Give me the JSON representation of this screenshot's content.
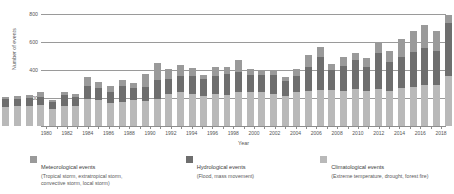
{
  "chart_data": {
    "type": "bar",
    "subtype": "stacked-bar",
    "title": "",
    "xlabel": "Year",
    "ylabel": "Number of events",
    "ylim": [
      0,
      800
    ],
    "y_ticks": [
      200,
      400,
      600,
      800
    ],
    "grid": true,
    "legend_position": "bottom",
    "categories": [
      "1980",
      "1981",
      "1982",
      "1983",
      "1984",
      "1985",
      "1986",
      "1987",
      "1988",
      "1989",
      "1990",
      "1991",
      "1992",
      "1993",
      "1994",
      "1995",
      "1996",
      "1997",
      "1998",
      "1999",
      "2000",
      "2001",
      "2002",
      "2003",
      "2004",
      "2005",
      "2006",
      "2007",
      "2008",
      "2009",
      "2010",
      "2011",
      "2012",
      "2013",
      "2014",
      "2015",
      "2016",
      "2017",
      "2018"
    ],
    "x_tick_labels": [
      "1980",
      "",
      "1982",
      "",
      "1984",
      "",
      "1986",
      "",
      "1988",
      "",
      "1990",
      "",
      "1992",
      "",
      "1994",
      "",
      "1996",
      "",
      "1998",
      "",
      "2000",
      "",
      "2002",
      "",
      "2004",
      "",
      "2006",
      "",
      "2008",
      "",
      "2010",
      "",
      "2012",
      "",
      "2014",
      "",
      "2016",
      "",
      "2018"
    ],
    "series": [
      {
        "name": "Climatological events",
        "color": "#b9b9b9",
        "values": [
          135,
          140,
          140,
          150,
          120,
          145,
          140,
          195,
          185,
          165,
          175,
          185,
          180,
          195,
          230,
          240,
          230,
          215,
          230,
          225,
          240,
          240,
          240,
          230,
          215,
          240,
          250,
          260,
          260,
          250,
          265,
          250,
          265,
          250,
          270,
          280,
          295,
          290,
          355
        ]
      },
      {
        "name": "Hydrological events",
        "color": "#6e6e6e",
        "values": [
          55,
          55,
          60,
          60,
          50,
          75,
          65,
          90,
          90,
          80,
          110,
          90,
          100,
          135,
          105,
          115,
          130,
          120,
          130,
          145,
          145,
          125,
          125,
          135,
          105,
          120,
          175,
          235,
          140,
          180,
          205,
          175,
          255,
          210,
          225,
          250,
          265,
          245,
          380
        ]
      },
      {
        "name": "Meteorological events",
        "color": "#9a9a9a",
        "values": [
          20,
          20,
          20,
          30,
          15,
          25,
          25,
          65,
          40,
          40,
          45,
          30,
          90,
          120,
          75,
          80,
          55,
          30,
          60,
          50,
          85,
          45,
          30,
          25,
          30,
          50,
          85,
          70,
          45,
          60,
          50,
          60,
          80,
          75,
          125,
          150,
          160,
          145,
          55
        ]
      }
    ],
    "totals": [
      210,
      215,
      220,
      240,
      185,
      245,
      230,
      350,
      315,
      285,
      330,
      305,
      370,
      450,
      410,
      435,
      415,
      365,
      420,
      420,
      470,
      410,
      395,
      390,
      350,
      410,
      510,
      565,
      445,
      490,
      520,
      485,
      600,
      535,
      620,
      680,
      720,
      680,
      790
    ]
  },
  "axes": {
    "y_title": "Number of events",
    "x_title": "Year"
  },
  "legend": {
    "items": [
      {
        "title": "Meteorological events",
        "sub_lines": [
          "(Tropical storm, extratropical storm,",
          "convective storm, local storm)"
        ],
        "color": "#9a9a9a"
      },
      {
        "title": "Hydrological events",
        "sub_lines": [
          "(Flood, mass movement)"
        ],
        "color": "#6e6e6e"
      },
      {
        "title": "Climatological events",
        "sub_lines": [
          "(Extreme temperature, drought, forest fire)"
        ],
        "color": "#b9b9b9"
      }
    ]
  }
}
